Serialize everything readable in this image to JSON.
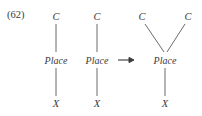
{
  "figure": {
    "equation_number": "(62)",
    "operator_symbol": "→",
    "background_color": "#ffffff",
    "ink_color": "#3a3a3a"
  },
  "trees": [
    {
      "id": "tree-left",
      "nodes": [
        {
          "name": "category-node",
          "label": "C",
          "x": 56,
          "y": 16
        },
        {
          "name": "place-node",
          "label": "Place",
          "x": 56,
          "y": 60
        },
        {
          "name": "variable-node",
          "label": "X",
          "x": 56,
          "y": 103
        }
      ],
      "edges": [
        {
          "name": "edge-c-to-place",
          "x1": 56,
          "y1": 24,
          "x2": 56,
          "y2": 52
        },
        {
          "name": "edge-place-to-x",
          "x1": 56,
          "y1": 68,
          "x2": 56,
          "y2": 96
        }
      ]
    },
    {
      "id": "tree-middle",
      "nodes": [
        {
          "name": "category-node",
          "label": "C",
          "x": 97,
          "y": 16
        },
        {
          "name": "place-node",
          "label": "Place",
          "x": 97,
          "y": 60
        },
        {
          "name": "variable-node",
          "label": "X",
          "x": 97,
          "y": 103
        }
      ],
      "edges": [
        {
          "name": "edge-c-to-place",
          "x1": 97,
          "y1": 24,
          "x2": 97,
          "y2": 52
        },
        {
          "name": "edge-place-to-x",
          "x1": 97,
          "y1": 68,
          "x2": 97,
          "y2": 96
        }
      ]
    },
    {
      "id": "tree-result",
      "nodes": [
        {
          "name": "category-node-left",
          "label": "C",
          "x": 142,
          "y": 16
        },
        {
          "name": "category-node-right",
          "label": "C",
          "x": 188,
          "y": 16
        },
        {
          "name": "place-node",
          "label": "Place",
          "x": 165,
          "y": 60
        },
        {
          "name": "variable-node",
          "label": "X",
          "x": 165,
          "y": 103
        }
      ],
      "edges": [
        {
          "name": "edge-left-c-to-place",
          "x1": 145,
          "y1": 24,
          "x2": 164,
          "y2": 52
        },
        {
          "name": "edge-right-c-to-place",
          "x1": 185,
          "y1": 24,
          "x2": 167,
          "y2": 52
        },
        {
          "name": "edge-place-to-x",
          "x1": 165,
          "y1": 68,
          "x2": 165,
          "y2": 96
        }
      ]
    }
  ],
  "arrow": {
    "name": "transformation-arrow",
    "x": 126,
    "y": 60
  }
}
